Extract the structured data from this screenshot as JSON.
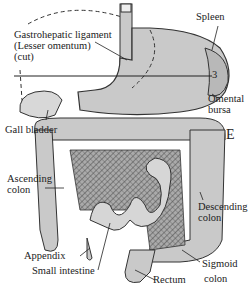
{
  "figure": {
    "section_marker": "3",
    "panel_letter": "E",
    "colors": {
      "organ_fill": "#c9c9c9",
      "outline": "#333333",
      "mesentery_hatch": "#555555",
      "background": "#ffffff"
    }
  },
  "labels": {
    "gastrohepatic_line1": "Gastrohepatic ligament",
    "gastrohepatic_line2": "(Lesser omentum)",
    "gastrohepatic_line3": "(cut)",
    "spleen": "Spleen",
    "omental_line1": "Omental",
    "omental_line2": "bursa",
    "gall_bladder": "Gall bladder",
    "ascending_line1": "Ascending",
    "ascending_line2": "colon",
    "descending_line1": "Descending",
    "descending_line2": "colon",
    "appendix": "Appendix",
    "small_intestine": "Small intestine",
    "rectum": "Rectum",
    "sigmoid_line1": "Sigmoid",
    "sigmoid_line2": "colon"
  }
}
